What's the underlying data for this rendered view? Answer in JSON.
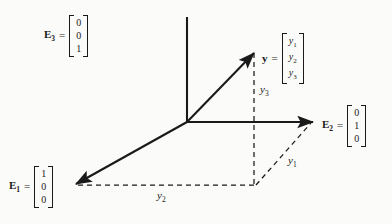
{
  "figure": {
    "kind": "3d-axes-vector-decomposition",
    "background_color": "#fbfbf9",
    "ink_color": "#1a1a1a"
  },
  "basis": {
    "e3": {
      "name": "E",
      "subscript": "3",
      "equals": "=",
      "components": [
        "0",
        "0",
        "1"
      ]
    },
    "e2": {
      "name": "E",
      "subscript": "2",
      "equals": "=",
      "components": [
        "0",
        "1",
        "0"
      ]
    },
    "e1": {
      "name": "E",
      "subscript": "1",
      "equals": "=",
      "components": [
        "1",
        "0",
        "0"
      ]
    }
  },
  "vector": {
    "name": "y",
    "equals": "=",
    "components": [
      {
        "base": "y",
        "sub": "1"
      },
      {
        "base": "y",
        "sub": "2"
      },
      {
        "base": "y",
        "sub": "3"
      }
    ]
  },
  "components": {
    "y1": {
      "base": "y",
      "sub": "1"
    },
    "y2": {
      "base": "y",
      "sub": "2"
    },
    "y3": {
      "base": "y",
      "sub": "3"
    }
  }
}
